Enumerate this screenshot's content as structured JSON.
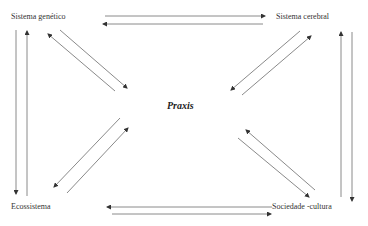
{
  "diagram": {
    "center_label": "Praxis",
    "nodes": [
      {
        "id": "genetico",
        "label": "Sistema genético"
      },
      {
        "id": "cerebral",
        "label": "Sistema cerebral"
      },
      {
        "id": "ecossistema",
        "label": "Ecossistema"
      },
      {
        "id": "sociedade",
        "label": "Sociedade -cultura"
      }
    ],
    "edges": [
      {
        "from": "Sistema genético",
        "to": "Sistema cerebral",
        "bidirectional": true
      },
      {
        "from": "Ecossistema",
        "to": "Sociedade -cultura",
        "bidirectional": true
      },
      {
        "from": "Sistema genético",
        "to": "Ecossistema",
        "bidirectional": true
      },
      {
        "from": "Sistema cerebral",
        "to": "Sociedade -cultura",
        "bidirectional": true
      },
      {
        "from": "Sistema genético",
        "to": "Praxis",
        "bidirectional": true
      },
      {
        "from": "Sistema cerebral",
        "to": "Praxis",
        "bidirectional": true
      },
      {
        "from": "Ecossistema",
        "to": "Praxis",
        "bidirectional": true
      },
      {
        "from": "Sociedade -cultura",
        "to": "Praxis",
        "bidirectional": true
      }
    ],
    "line_color": "#8a8a8a",
    "arrow_color": "#333333"
  }
}
